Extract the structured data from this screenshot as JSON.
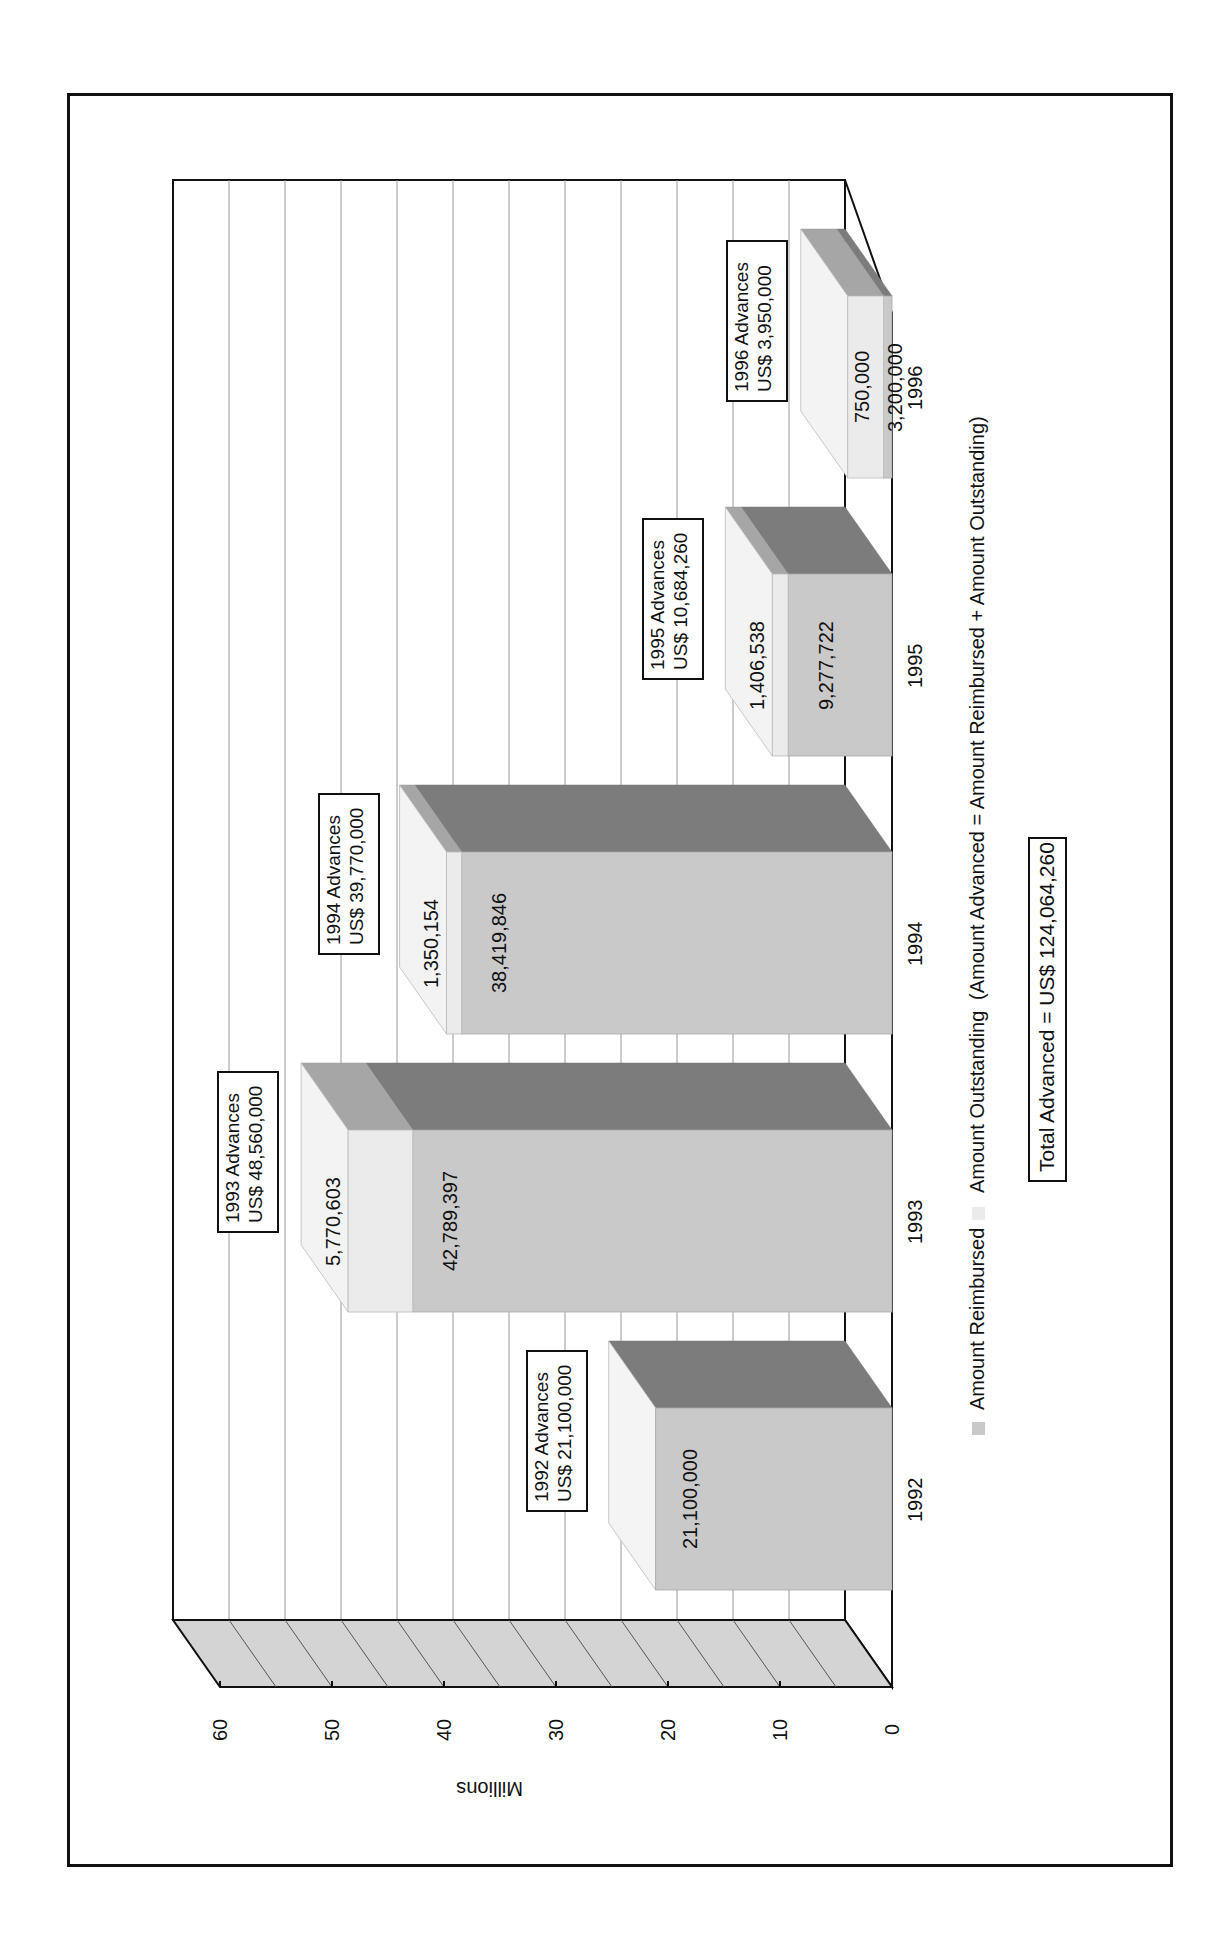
{
  "colors": {
    "reimbursed_front": "#c9c9c9",
    "reimbursed_top": "#7c7c7c",
    "outstanding_front": "#ebebeb",
    "outstanding_side": "#f3f3f3",
    "outstanding_top": "#a6a6a6",
    "floor": "#d4d4d4",
    "grid": "#9a9a9a",
    "axis": "#111111"
  },
  "axis": {
    "title": "Millions",
    "ticks": [
      "0",
      "10",
      "20",
      "30",
      "40",
      "50",
      "60"
    ]
  },
  "legend": {
    "items": [
      {
        "label": "Amount Reimbursed",
        "color": "#c9c9c9"
      },
      {
        "label": "Amount Outstanding",
        "color": "#ebebeb"
      }
    ],
    "formula": "(Amount Advanced = Amount Reimbursed + Amount Outstanding)"
  },
  "total_label": "Total Advanced = US$ 124,064,260",
  "bars": [
    {
      "year": "1992",
      "box_line1": "1992 Advances",
      "box_line2": "US$ 21,100,000",
      "reimbursed_label": "21,100,000",
      "outstanding_label": ""
    },
    {
      "year": "1993",
      "box_line1": "1993 Advances",
      "box_line2": "US$ 48,560,000",
      "reimbursed_label": "42,789,397",
      "outstanding_label": "5,770,603"
    },
    {
      "year": "1994",
      "box_line1": "1994 Advances",
      "box_line2": "US$ 39,770,000",
      "reimbursed_label": "38,419,846",
      "outstanding_label": "1,350,154"
    },
    {
      "year": "1995",
      "box_line1": "1995 Advances",
      "box_line2": "US$ 10,684,260",
      "reimbursed_label": "9,277,722",
      "outstanding_label": "1,406,538"
    },
    {
      "year": "1996",
      "box_line1": "1996 Advances",
      "box_line2": "US$ 3,950,000",
      "reimbursed_label": "750,000",
      "outstanding_label": "3,200,000"
    }
  ],
  "chart_data": {
    "type": "bar",
    "subtype": "stacked-3d",
    "orientation": "rotated-90",
    "title": "",
    "categories": [
      "1992",
      "1993",
      "1994",
      "1995",
      "1996"
    ],
    "series": [
      {
        "name": "Amount Reimbursed",
        "values": [
          21100000,
          42789397,
          38419846,
          9277722,
          750000
        ]
      },
      {
        "name": "Amount Outstanding",
        "values": [
          0,
          5770603,
          1350154,
          1406538,
          3200000
        ]
      }
    ],
    "totals": [
      21100000,
      48560000,
      39770000,
      10684260,
      3950000
    ],
    "grand_total": 124064260,
    "xlabel": "",
    "ylabel": "Millions",
    "ylim": [
      0,
      60
    ],
    "yticks": [
      0,
      10,
      20,
      30,
      40,
      50,
      60
    ],
    "grid": true,
    "legend_position": "bottom",
    "annotations": [
      "1992 Advances US$ 21,100,000",
      "1993 Advances US$ 48,560,000",
      "1994 Advances US$ 39,770,000",
      "1995 Advances US$ 10,684,260",
      "1996 Advances US$ 3,950,000",
      "(Amount Advanced = Amount Reimbursed + Amount Outstanding)",
      "Total Advanced = US$ 124,064,260"
    ]
  }
}
